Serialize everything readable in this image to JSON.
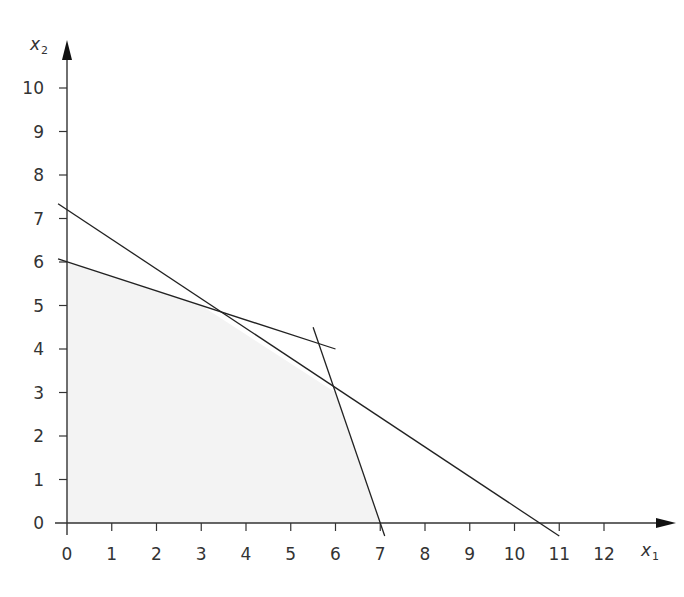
{
  "chart_data": {
    "type": "line",
    "title": "",
    "xlabel": "x1",
    "ylabel": "x2",
    "xlabel_main": "x",
    "xlabel_sub": "1",
    "ylabel_main": "x",
    "ylabel_sub": "2",
    "xlim": [
      0,
      12.5
    ],
    "ylim": [
      0,
      10.5
    ],
    "x_ticks": [
      0,
      1,
      2,
      3,
      4,
      5,
      6,
      7,
      8,
      9,
      10,
      11,
      12
    ],
    "y_ticks": [
      0,
      1,
      2,
      3,
      4,
      5,
      6,
      7,
      8,
      9,
      10
    ],
    "grid": false,
    "legend": null,
    "series": [
      {
        "name": "constraint-line-1",
        "description": "x2 intercept 7.2, x1 intercept 10.5",
        "points": [
          [
            -0.2,
            7.34
          ],
          [
            11.0,
            -0.3
          ]
        ]
      },
      {
        "name": "constraint-line-2",
        "description": "x2 intercept 6, slope -1/3",
        "points": [
          [
            -0.2,
            6.07
          ],
          [
            6.0,
            4.0
          ]
        ]
      },
      {
        "name": "constraint-line-3",
        "description": "steep line through (6,3) and (7,0)",
        "points": [
          [
            5.5,
            4.5
          ],
          [
            7.1,
            -0.3
          ]
        ]
      }
    ],
    "feasible_region": {
      "fill": "#f3f3f3",
      "vertices": [
        [
          0,
          0
        ],
        [
          0,
          6
        ],
        [
          3,
          5
        ],
        [
          6,
          3
        ],
        [
          7,
          0
        ]
      ]
    },
    "intersections": [
      [
        3,
        5
      ],
      [
        6,
        3
      ]
    ]
  },
  "colors": {
    "line": "#222222",
    "axis": "#333333",
    "region": "#f3f3f3"
  }
}
